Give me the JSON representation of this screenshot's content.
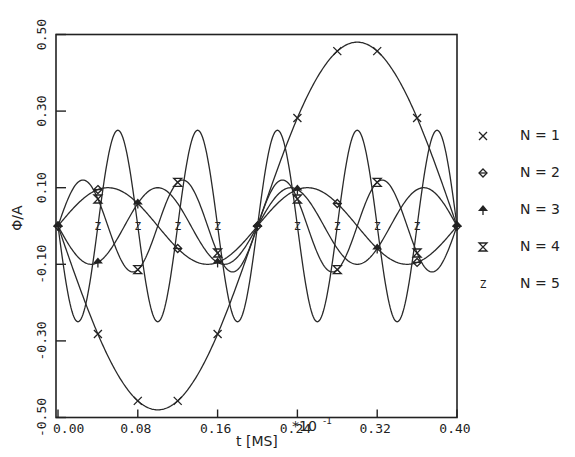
{
  "chart_data": {
    "type": "line",
    "title": "",
    "xlabel": "t  [MS]",
    "x_multiplier_label": "*10",
    "x_multiplier_exponent": "-1",
    "ylabel": "Φ/A",
    "xlim": [
      0.0,
      0.4
    ],
    "ylim": [
      -0.5,
      0.5
    ],
    "x_ticks": [
      0.0,
      0.08,
      0.16,
      0.24,
      0.32,
      0.4
    ],
    "x_tick_labels": [
      "0.00",
      "0.08",
      "0.16",
      "0.24",
      "0.32",
      "0.40"
    ],
    "y_ticks": [
      -0.5,
      -0.3,
      -0.1,
      0.1,
      0.3,
      0.5
    ],
    "y_tick_labels": [
      "-0.50",
      "-0.30",
      "-0.10",
      "0.10",
      "0.30",
      "0.50"
    ],
    "grid": false,
    "legend_position": "right",
    "x": [
      0.0,
      0.02,
      0.04,
      0.06,
      0.08,
      0.1,
      0.12,
      0.14,
      0.16,
      0.18,
      0.2,
      0.22,
      0.24,
      0.26,
      0.28,
      0.3,
      0.32,
      0.34,
      0.36,
      0.38,
      0.4
    ],
    "series": [
      {
        "name": "N = 1",
        "marker": "x",
        "amplitude": -0.48,
        "harmonic": 1,
        "values": [
          0.0,
          -0.15,
          -0.28,
          -0.39,
          -0.46,
          -0.48,
          -0.46,
          -0.39,
          -0.28,
          -0.15,
          0.0,
          0.15,
          0.28,
          0.39,
          0.46,
          0.48,
          0.46,
          0.39,
          0.28,
          0.15,
          0.0
        ]
      },
      {
        "name": "N = 2",
        "marker": "diamond",
        "amplitude": 0.1,
        "harmonic": 2,
        "values": [
          0.0,
          0.06,
          0.1,
          0.1,
          0.06,
          0.0,
          -0.06,
          -0.1,
          -0.1,
          -0.06,
          0.0,
          0.06,
          0.1,
          0.1,
          0.06,
          0.0,
          -0.06,
          -0.1,
          -0.1,
          -0.06,
          0.0
        ]
      },
      {
        "name": "N = 3",
        "marker": "arrow-up",
        "amplitude": -0.1,
        "harmonic": 3,
        "values": [
          0.0,
          -0.08,
          -0.1,
          -0.03,
          0.06,
          0.1,
          0.06,
          -0.03,
          -0.1,
          -0.08,
          0.0,
          0.08,
          0.1,
          0.03,
          -0.06,
          -0.1,
          -0.06,
          0.03,
          0.1,
          0.08,
          0.0
        ]
      },
      {
        "name": "N = 4",
        "marker": "hourglass",
        "amplitude": 0.12,
        "harmonic": 4,
        "values": [
          0.0,
          0.11,
          0.07,
          -0.07,
          -0.11,
          0.0,
          0.11,
          0.07,
          -0.07,
          -0.11,
          0.0,
          0.11,
          0.07,
          -0.07,
          -0.11,
          0.0,
          0.11,
          0.07,
          -0.07,
          -0.11,
          0.0
        ]
      },
      {
        "name": "N = 5",
        "marker": "Z",
        "amplitude": -0.25,
        "harmonic": 5,
        "values": [
          0.0,
          -0.25,
          0.0,
          0.25,
          0.0,
          -0.25,
          0.0,
          0.25,
          0.0,
          -0.25,
          0.0,
          0.25,
          0.0,
          -0.25,
          0.0,
          0.25,
          0.0,
          -0.25,
          0.0,
          0.25,
          0.0
        ]
      }
    ],
    "marker_positions": {
      "N = 1": [
        0.04,
        0.08,
        0.12,
        0.16,
        0.24,
        0.28,
        0.32,
        0.36
      ],
      "N = 2": [
        0.0,
        0.04,
        0.12,
        0.2,
        0.28,
        0.36,
        0.4
      ],
      "N = 3": [
        0.0,
        0.04,
        0.08,
        0.16,
        0.2,
        0.24,
        0.32,
        0.4
      ],
      "N = 4": [
        0.04,
        0.08,
        0.12,
        0.16,
        0.24,
        0.28,
        0.32,
        0.36
      ],
      "N = 5": [
        0.04,
        0.08,
        0.12,
        0.16,
        0.24,
        0.28,
        0.32,
        0.36
      ]
    }
  },
  "legend": {
    "items": [
      {
        "symbol": "×",
        "label": "N = 1"
      },
      {
        "symbol": "◇",
        "label": "N = 2"
      },
      {
        "symbol": "↑",
        "label": "N = 3"
      },
      {
        "symbol": "⊼",
        "label": "N = 4"
      },
      {
        "symbol": "Z",
        "label": "N = 5"
      }
    ]
  },
  "axes": {
    "ylabel": "Φ/A",
    "xlabel": "t  [MS]",
    "x_multiplier": "*10",
    "x_multiplier_exp": "-1"
  }
}
